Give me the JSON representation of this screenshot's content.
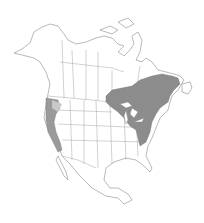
{
  "map": {
    "type": "species-range-map",
    "region": "North America",
    "legend": [],
    "colors": {
      "background": "#ffffff",
      "outline": "#8a8a8a",
      "range_primary": "#8c8c8c",
      "range_secondary": "#b4b4b4"
    },
    "ranges": [
      {
        "name": "eastern-range",
        "description": "Eastern Canada, Great Lakes region, and northeastern United States down the Appalachians"
      },
      {
        "name": "western-range",
        "description": "Pacific coast from southern British Columbia through Oregon into California"
      }
    ]
  }
}
